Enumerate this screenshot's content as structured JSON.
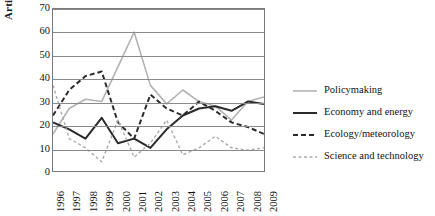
{
  "chart_data": {
    "type": "line",
    "title": "",
    "xlabel": "",
    "ylabel": "Articles (%)",
    "x": [
      1996,
      1997,
      1998,
      1999,
      2000,
      2001,
      2002,
      2003,
      2004,
      2005,
      2006,
      2007,
      2008,
      2009
    ],
    "xtick_labels": [
      "1996",
      "1997",
      "1998",
      "1999",
      "2000",
      "2001",
      "2002",
      "2003",
      "2004",
      "2005",
      "2006",
      "2007",
      "2008",
      "2009"
    ],
    "ytick_labels": [
      "0",
      "10",
      "20",
      "30",
      "40",
      "50",
      "60",
      "70"
    ],
    "ylim": [
      0,
      70
    ],
    "ytick_step": 10,
    "grid": true,
    "legend_position": "right",
    "series": [
      {
        "name": "Policymaking",
        "color": "#b3b3b3",
        "style": "solid",
        "width": 1.6,
        "values": [
          16,
          27,
          31,
          30,
          45,
          60,
          37,
          29,
          35,
          30,
          28,
          22,
          30,
          32
        ]
      },
      {
        "name": "Economy and energy",
        "color": "#2b2b2b",
        "style": "solid",
        "width": 2.0,
        "values": [
          21,
          18,
          14,
          23,
          12,
          14,
          10,
          18,
          24,
          27,
          28,
          26,
          30,
          29
        ]
      },
      {
        "name": "Ecology/meteorology",
        "color": "#2b2b2b",
        "style": "dashed",
        "width": 2.0,
        "values": [
          24,
          35,
          41,
          43,
          21,
          14,
          33,
          27,
          24,
          30,
          26,
          21,
          19,
          16
        ]
      },
      {
        "name": "Science and technology",
        "color": "#aaaaaa",
        "style": "dashed",
        "width": 1.4,
        "values": [
          37,
          14,
          10,
          4,
          22,
          6,
          12,
          22,
          7,
          10,
          15,
          10,
          9,
          10
        ]
      }
    ]
  },
  "legend": {
    "items": [
      {
        "label": "Policymaking"
      },
      {
        "label": "Economy and energy"
      },
      {
        "label": "Ecology/meteorology"
      },
      {
        "label": "Science and technology"
      }
    ]
  }
}
